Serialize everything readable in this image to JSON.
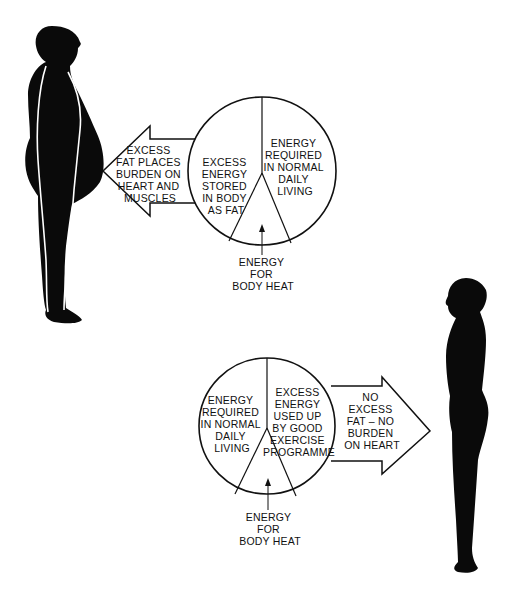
{
  "colors": {
    "ink": "#0a0a0a",
    "background": "#ffffff"
  },
  "top_diagram": {
    "figure": "overweight-man-silhouette",
    "arrow_direction": "left",
    "arrow_text": [
      "EXCESS",
      "FAT PLACES",
      "BURDEN ON",
      "HEART AND",
      "MUSCLES"
    ],
    "pie_left_segment": [
      "EXCESS",
      "ENERGY",
      "STORED",
      "IN BODY",
      "AS FAT"
    ],
    "pie_right_segment": [
      "ENERGY",
      "REQUIRED",
      "IN NORMAL",
      "DAILY",
      "LIVING"
    ],
    "pie_bottom_label": [
      "ENERGY",
      "FOR",
      "BODY HEAT"
    ]
  },
  "bottom_diagram": {
    "figure": "fit-man-silhouette",
    "arrow_direction": "right",
    "arrow_text": [
      "NO",
      "EXCESS",
      "FAT – NO",
      "BURDEN",
      "ON HEART"
    ],
    "pie_left_segment": [
      "ENERGY",
      "REQUIRED",
      "IN NORMAL",
      "DAILY",
      "LIVING"
    ],
    "pie_right_segment": [
      "EXCESS",
      "ENERGY",
      "USED UP",
      "BY GOOD",
      "EXERCISE",
      "PROGRAMME"
    ],
    "pie_bottom_label": [
      "ENERGY",
      "FOR",
      "BODY HEAT"
    ]
  }
}
